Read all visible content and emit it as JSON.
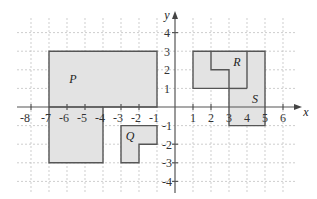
{
  "diagram": {
    "type": "coordinate-grid",
    "axes": {
      "x_label": "x",
      "y_label": "y",
      "x_ticks": [
        "-8",
        "-7",
        "-6",
        "-5",
        "-4",
        "-3",
        "-2",
        "-1",
        "1",
        "2",
        "3",
        "4",
        "5",
        "6"
      ],
      "y_ticks": [
        "4",
        "3",
        "2",
        "1",
        "-1",
        "-2",
        "-3",
        "-4"
      ],
      "x_range": [
        -8,
        6
      ],
      "y_range": [
        -4,
        4
      ]
    },
    "shapes": [
      {
        "label": "P",
        "vertices": [
          [
            -7,
            3
          ],
          [
            -1,
            3
          ],
          [
            -1,
            0
          ],
          [
            -4,
            0
          ],
          [
            -4,
            -3
          ],
          [
            -7,
            -3
          ]
        ]
      },
      {
        "label": "Q",
        "vertices": [
          [
            -3,
            -1
          ],
          [
            -1,
            -1
          ],
          [
            -1,
            -2
          ],
          [
            -2,
            -2
          ],
          [
            -2,
            -3
          ],
          [
            -3,
            -3
          ]
        ]
      },
      {
        "label": "R",
        "vertices": [
          [
            1,
            3
          ],
          [
            4,
            3
          ],
          [
            4,
            1
          ],
          [
            1,
            1
          ]
        ]
      },
      {
        "label": "S",
        "vertices": [
          [
            2,
            3
          ],
          [
            5,
            3
          ],
          [
            5,
            -1
          ],
          [
            3,
            -1
          ],
          [
            3,
            2
          ],
          [
            2,
            2
          ]
        ]
      }
    ],
    "colors": {
      "fill": "#e3e3e3",
      "stroke": "#555555",
      "grid": "#b9b9b9"
    }
  }
}
